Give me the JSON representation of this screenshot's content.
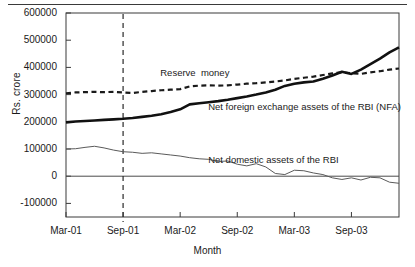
{
  "chart_data": {
    "type": "line",
    "title": "",
    "xlabel": "Month",
    "ylabel": "Rs. crore",
    "ylim": [
      -150000,
      600000
    ],
    "yticks": [
      600000,
      500000,
      400000,
      300000,
      200000,
      100000,
      0,
      -100000
    ],
    "ytick_labels": [
      "600000",
      "500000",
      "400000",
      "300000",
      "200000",
      "100000",
      "0",
      "-100000"
    ],
    "grid": false,
    "legend_position": "inline-annotations",
    "x": [
      "Mar-01",
      "Apr-01",
      "May-01",
      "Jun-01",
      "Jul-01",
      "Aug-01",
      "Sep-01",
      "Oct-01",
      "Nov-01",
      "Dec-01",
      "Jan-02",
      "Feb-02",
      "Mar-02",
      "Apr-02",
      "May-02",
      "Jun-02",
      "Jul-02",
      "Aug-02",
      "Sep-02",
      "Oct-02",
      "Nov-02",
      "Dec-02",
      "Jan-03",
      "Feb-03",
      "Mar-03",
      "Apr-03",
      "May-03",
      "Jun-03",
      "Jul-03",
      "Aug-03",
      "Sep-03",
      "Oct-03",
      "Nov-03",
      "Dec-03",
      "Jan-04",
      "Feb-04"
    ],
    "xticks": [
      "Mar-01",
      "Sep-01",
      "Mar-02",
      "Sep-02",
      "Mar-03",
      "Sep-03"
    ],
    "xtick_indices": [
      0,
      6,
      12,
      18,
      24,
      30
    ],
    "series": [
      {
        "name": "Reserve money",
        "style": "dashed",
        "color": "#1a1a1a",
        "width": 2.2,
        "values": [
          305000,
          308000,
          309000,
          310000,
          309000,
          310000,
          308000,
          306000,
          310000,
          313000,
          316000,
          318000,
          320000,
          330000,
          333000,
          334000,
          333000,
          334000,
          337000,
          340000,
          342000,
          345000,
          348000,
          352000,
          358000,
          362000,
          366000,
          372000,
          378000,
          382000,
          379000,
          376000,
          382000,
          386000,
          392000,
          396000
        ]
      },
      {
        "name": "Net foreign exchange assets of the RBI (NFA)",
        "style": "solid",
        "color": "#111111",
        "width": 2.6,
        "values": [
          198000,
          201000,
          203000,
          205000,
          207000,
          209000,
          211000,
          214000,
          218000,
          222000,
          228000,
          236000,
          246000,
          264000,
          268000,
          272000,
          276000,
          281000,
          287000,
          293000,
          300000,
          308000,
          318000,
          332000,
          340000,
          345000,
          348000,
          358000,
          370000,
          384000,
          376000,
          392000,
          412000,
          432000,
          455000,
          474000
        ]
      },
      {
        "name": "Net domestic assets of the RBI",
        "style": "solid",
        "color": "#5a5a5a",
        "width": 1.0,
        "values": [
          100000,
          101000,
          106000,
          110000,
          104000,
          96000,
          90000,
          88000,
          84000,
          86000,
          82000,
          78000,
          74000,
          68000,
          64000,
          62000,
          54000,
          56000,
          44000,
          38000,
          46000,
          34000,
          10000,
          6000,
          22000,
          20000,
          12000,
          6000,
          -6000,
          -12000,
          -6000,
          -14000,
          -4000,
          -6000,
          -22000,
          -26000
        ]
      }
    ],
    "annotations": [
      {
        "name": "reserve-money-label",
        "text": "Reserve  money",
        "x_pct": 28.6,
        "y_pct": 26.3
      },
      {
        "name": "nfa-label",
        "text": "Net foreign exchange assets of the RBI (NFA)",
        "x_pct": 43.0,
        "y_pct": 43.0
      },
      {
        "name": "nda-label",
        "text": "Net domestic assets of the RBI",
        "x_pct": 43.0,
        "y_pct": 69.0
      }
    ],
    "vertical_marker": {
      "name": "sep-01-marker",
      "at": "Sep-01",
      "style": "dashed"
    }
  }
}
